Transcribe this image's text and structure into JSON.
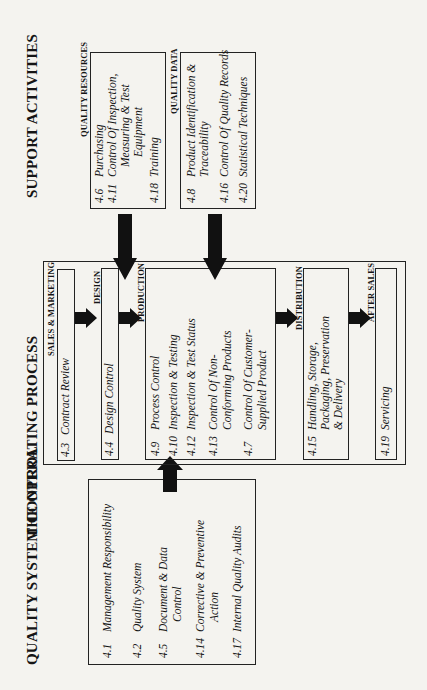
{
  "titles": {
    "quality_system_control": "QUALITY SYSTEM CONTROL",
    "operating_process": "THE OPERATING PROCESS",
    "support_activities": "SUPPORT ACTIVITIES"
  },
  "quality_system_control": {
    "items": [
      {
        "num": "4.1",
        "lines": [
          "Management Responsibility"
        ]
      },
      {
        "num": "4.2",
        "lines": [
          "Quality System"
        ]
      },
      {
        "num": "4.5",
        "lines": [
          "Document & Data",
          "Control"
        ]
      },
      {
        "num": "4.14",
        "lines": [
          "Corrective & Preventive",
          "Action"
        ]
      },
      {
        "num": "4.17",
        "lines": [
          "Internal Quality Audits"
        ]
      }
    ]
  },
  "operating_process": {
    "stages": [
      {
        "caption": "SALES & MARKETING",
        "items": [
          {
            "num": "4.3",
            "lines": [
              "Contract Review"
            ]
          }
        ]
      },
      {
        "caption": "DESIGN",
        "items": [
          {
            "num": "4.4",
            "lines": [
              "Design Control"
            ]
          }
        ]
      },
      {
        "caption": "PRODUCTION",
        "items": [
          {
            "num": "4.9",
            "lines": [
              "Process Control"
            ]
          },
          {
            "num": "4.10",
            "lines": [
              "Inspection & Testing"
            ]
          },
          {
            "num": "4.12",
            "lines": [
              "Inspection & Test Status"
            ]
          },
          {
            "num": "4.13",
            "lines": [
              "Control Of Non-",
              "Conforming Products"
            ]
          },
          {
            "num": "4.7",
            "lines": [
              "Control Of Customer-",
              "Supplied Product"
            ]
          }
        ]
      },
      {
        "caption": "DISTRIBUTION",
        "items": [
          {
            "num": "4.15",
            "lines": [
              "Handling, Storage,",
              "Packaging, Preservation",
              "& Delivery"
            ]
          }
        ]
      },
      {
        "caption": "AFTER SALES",
        "items": [
          {
            "num": "4.19",
            "lines": [
              "Servicing"
            ]
          }
        ]
      }
    ]
  },
  "support_activities": {
    "quality_resources": {
      "caption": "QUALITY RESOURCES",
      "items": [
        {
          "num": "4.6",
          "lines": [
            "Purchasing"
          ]
        },
        {
          "num": "4.11",
          "lines": [
            "Control Of Inspection,",
            "Measuring & Test",
            "Equipment"
          ]
        },
        {
          "num": "4.18",
          "lines": [
            "Training"
          ]
        }
      ]
    },
    "quality_data": {
      "caption": "QUALITY DATA",
      "items": [
        {
          "num": "4.8",
          "lines": [
            "Product Identification &",
            "Traceability"
          ]
        },
        {
          "num": "4.16",
          "lines": [
            "Control Of Quality Records"
          ]
        },
        {
          "num": "4.20",
          "lines": [
            "Statistical Techniques"
          ]
        }
      ]
    }
  },
  "colors": {
    "ink": "#151515",
    "paper": "#f4f3ef"
  }
}
